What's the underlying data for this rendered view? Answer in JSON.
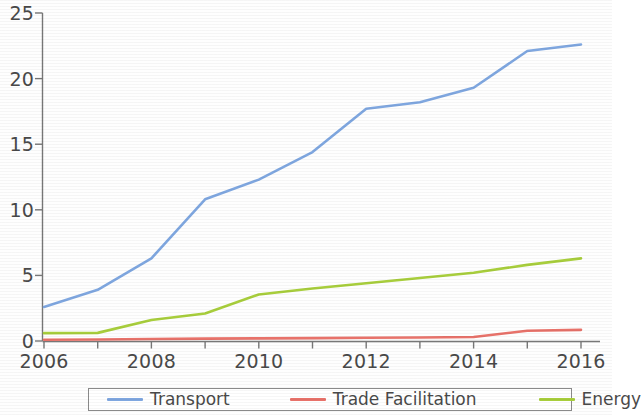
{
  "chart_data": {
    "type": "line",
    "title": "",
    "xlabel": "",
    "ylabel": "",
    "x": [
      2006,
      2007,
      2008,
      2009,
      2010,
      2011,
      2012,
      2013,
      2014,
      2015,
      2016
    ],
    "xlim": [
      2006,
      2016
    ],
    "ylim": [
      0,
      25
    ],
    "yticks": [
      0,
      5,
      10,
      15,
      20,
      25
    ],
    "ytick_labels": [
      "0",
      "5",
      "10",
      "15",
      "20",
      "25"
    ],
    "xticks": [
      2006,
      2007,
      2008,
      2009,
      2010,
      2011,
      2012,
      2013,
      2014,
      2015,
      2016
    ],
    "xtick_labels_shown": [
      "2006",
      "2008",
      "2010",
      "2012",
      "2014",
      "2016"
    ],
    "grid": false,
    "legend_position": "bottom",
    "series": [
      {
        "name": "Transport",
        "color": "#7FA7E0",
        "values": [
          2.6,
          3.9,
          6.3,
          10.8,
          12.3,
          14.4,
          17.7,
          18.2,
          19.3,
          22.1,
          22.6
        ]
      },
      {
        "name": "Trade Facilitation",
        "color": "#E8726A",
        "values": [
          0.1,
          0.12,
          0.15,
          0.18,
          0.2,
          0.22,
          0.25,
          0.27,
          0.3,
          0.78,
          0.85
        ]
      },
      {
        "name": "Energy",
        "color": "#A8CE3C",
        "values": [
          0.6,
          0.62,
          1.6,
          2.1,
          3.55,
          4.0,
          4.4,
          4.8,
          5.2,
          5.8,
          6.3
        ]
      }
    ]
  },
  "legend": {
    "entries": [
      {
        "label": "Transport"
      },
      {
        "label": "Trade Facilitation"
      },
      {
        "label": "Energy"
      }
    ]
  },
  "axes": {
    "y_labels": [
      "25",
      "20",
      "15",
      "10",
      "5",
      "0"
    ],
    "x_labels": [
      "2006",
      "2008",
      "2010",
      "2012",
      "2014",
      "2016"
    ]
  }
}
